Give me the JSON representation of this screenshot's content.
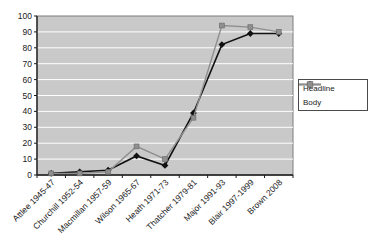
{
  "chart_data": {
    "type": "line",
    "title": "",
    "xlabel": "",
    "ylabel": "",
    "categories": [
      "Attlee 1945-47",
      "Churchill 1952-54",
      "Macmillan 1957-59",
      "Wilson 1965-67",
      "Heath 1971-73",
      "Thatcher 1979-81",
      "Major 1991-93",
      "Blair 1997-1999",
      "Brown 2008"
    ],
    "series": [
      {
        "name": "Headline",
        "color": "#111111",
        "marker": "diamond",
        "values": [
          1,
          2,
          3,
          12,
          6,
          39,
          82,
          89,
          89
        ]
      },
      {
        "name": "Body",
        "color": "#8f8f8f",
        "marker": "square",
        "values": [
          1,
          1,
          2,
          18,
          10,
          36,
          94,
          93,
          90
        ]
      }
    ],
    "ylim": [
      0,
      100
    ],
    "yticks": [
      0,
      10,
      20,
      30,
      40,
      50,
      60,
      70,
      80,
      90,
      100
    ],
    "grid": "horizontal",
    "gridline_color": "#ffffff",
    "plot_bg": "#c9c9c9",
    "legend_position": "right"
  }
}
